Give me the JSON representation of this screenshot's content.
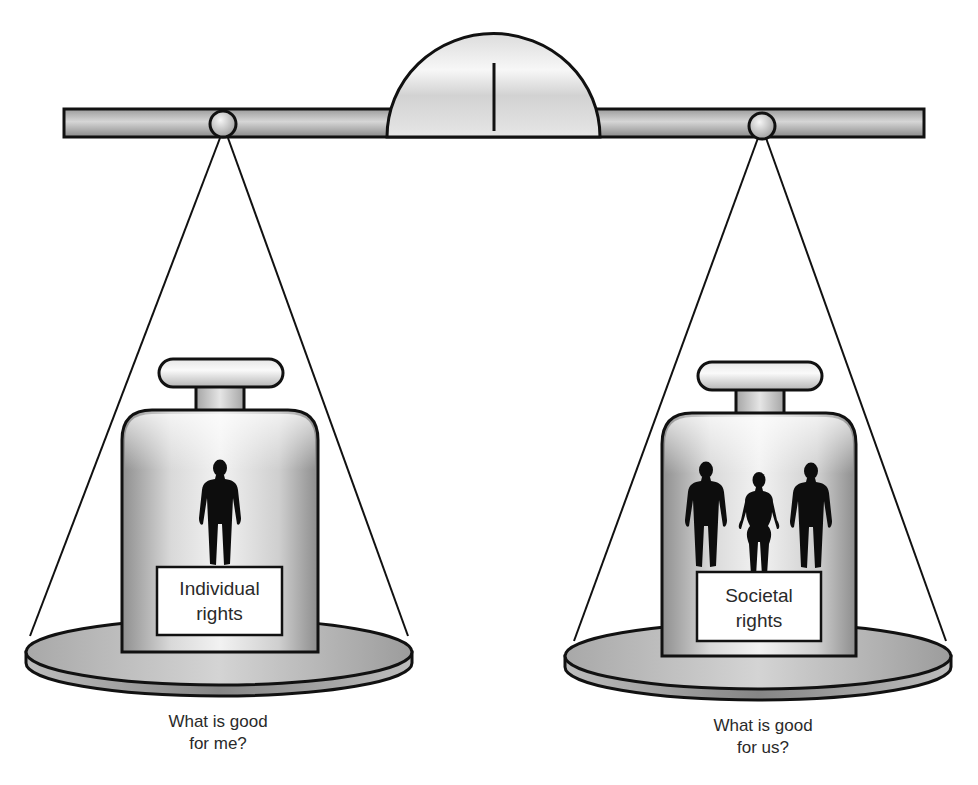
{
  "diagram": {
    "type": "balance-scale",
    "left_pan": {
      "weight_label_line1": "Individual",
      "weight_label_line2": "rights",
      "figure_count": 1,
      "caption_line1": "What is good",
      "caption_line2": "for me?"
    },
    "right_pan": {
      "weight_label_line1": "Societal",
      "weight_label_line2": "rights",
      "figure_count": 3,
      "caption_line1": "What is good",
      "caption_line2": "for us?"
    },
    "colors": {
      "outline": "#111111",
      "metal_light": "#f4f4f4",
      "metal_mid": "#c8c8c8",
      "metal_dark": "#8e8e8e",
      "silhouette": "#0d0d0d",
      "label_bg": "#ffffff"
    }
  }
}
